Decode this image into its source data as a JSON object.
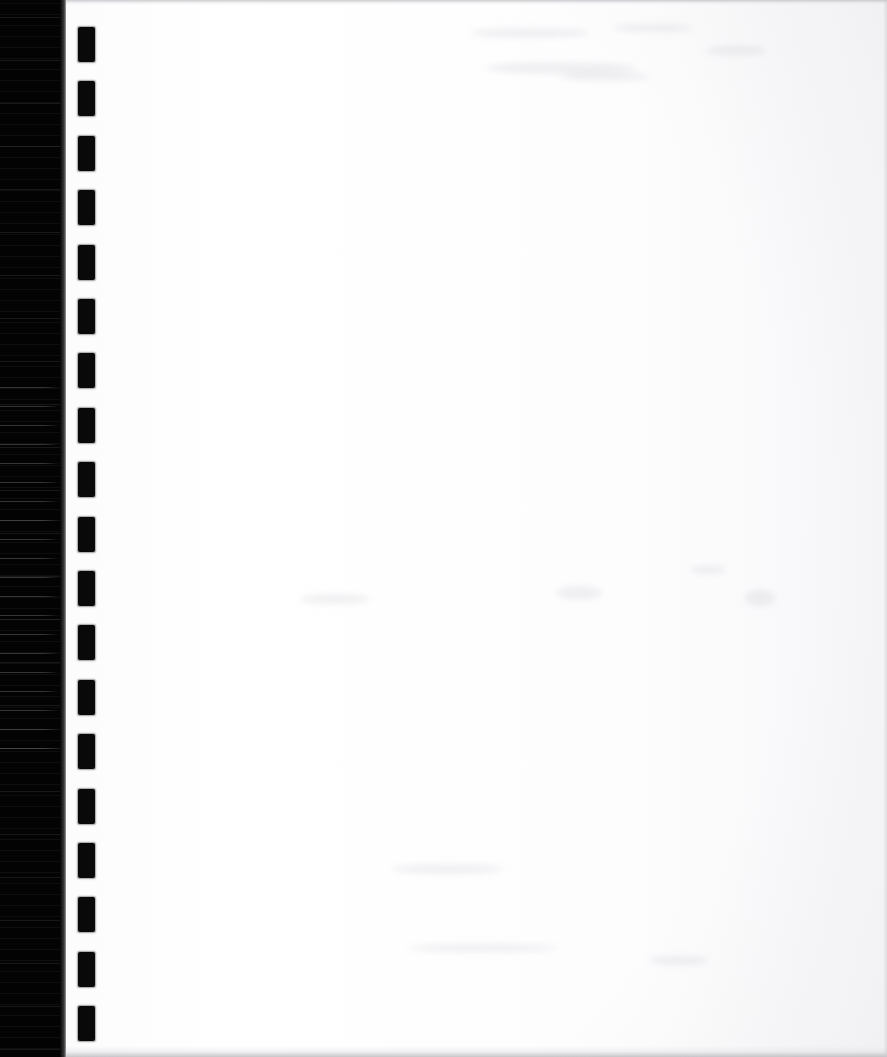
{
  "document": {
    "kind": "scanned-page",
    "title": "Scanned blank page",
    "page_width": 887,
    "page_height": 1057,
    "content_text": "",
    "note": "Blank recto of a comb/spiral-bound document; no printed text visible."
  },
  "colors": {
    "scanner_background": "#030303",
    "paper": "#fdfdfd",
    "paper_shade": "#f2f2f4",
    "hole_fill": "#090909",
    "edge_line": "#c4c4c8"
  },
  "scan_margin": {
    "name": "scanner-dark-margin",
    "left": 0,
    "width": 60,
    "falloff_left": 60,
    "falloff_width": 9
  },
  "paper": {
    "left": 66,
    "width": 821
  },
  "binding_holes": {
    "name": "comb-binding-hole-column",
    "count": 19,
    "left": 78,
    "width": 17,
    "height": 35,
    "first_top": 27,
    "pitch": 54.4
  },
  "smudges": [
    {
      "x": 470,
      "y": 28,
      "w": 120,
      "h": 10
    },
    {
      "x": 612,
      "y": 24,
      "w": 80,
      "h": 8
    },
    {
      "x": 706,
      "y": 46,
      "w": 60,
      "h": 9
    },
    {
      "x": 486,
      "y": 62,
      "w": 150,
      "h": 12
    },
    {
      "x": 560,
      "y": 72,
      "w": 90,
      "h": 9
    },
    {
      "x": 300,
      "y": 594,
      "w": 70,
      "h": 10
    },
    {
      "x": 556,
      "y": 586,
      "w": 46,
      "h": 14
    },
    {
      "x": 690,
      "y": 566,
      "w": 36,
      "h": 8
    },
    {
      "x": 745,
      "y": 590,
      "w": 30,
      "h": 16
    },
    {
      "x": 392,
      "y": 864,
      "w": 110,
      "h": 10
    },
    {
      "x": 648,
      "y": 956,
      "w": 60,
      "h": 9
    },
    {
      "x": 408,
      "y": 944,
      "w": 150,
      "h": 8
    }
  ]
}
